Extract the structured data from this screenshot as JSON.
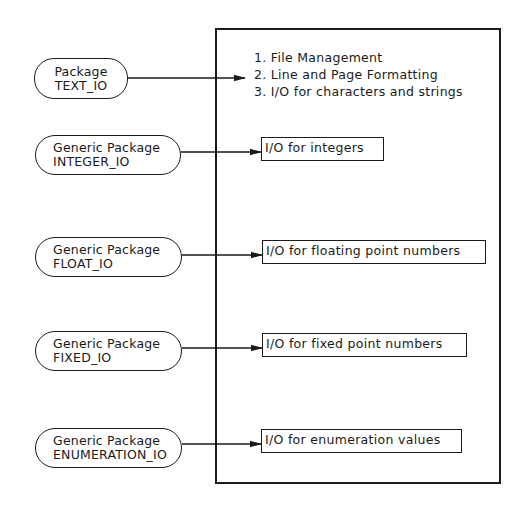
{
  "diagram": {
    "packages": [
      {
        "kind": "Package",
        "name": "TEXT_IO"
      },
      {
        "kind": "Generic Package",
        "name": "INTEGER_IO"
      },
      {
        "kind": "Generic Package",
        "name": "FLOAT_IO"
      },
      {
        "kind": "Generic Package",
        "name": "FIXED_IO"
      },
      {
        "kind": "Generic Package",
        "name": "ENUMERATION_IO"
      }
    ],
    "text_io_features": [
      "1. File Management",
      "2. Line and Page Formatting",
      "3. I/O for characters and strings"
    ],
    "outputs": [
      "I/O for integers",
      "I/O for floating point numbers",
      "I/O for fixed point numbers",
      "I/O for enumeration values"
    ],
    "colors": {
      "stroke": "#1a1a1a",
      "background": "#ffffff"
    }
  }
}
